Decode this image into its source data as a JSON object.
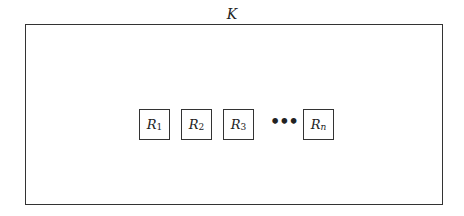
{
  "diagram": {
    "container_label": "K",
    "elements": [
      {
        "base": "R",
        "subscript": "1"
      },
      {
        "base": "R",
        "subscript": "2"
      },
      {
        "base": "R",
        "subscript": "3"
      },
      {
        "ellipsis": "•••"
      },
      {
        "base": "R",
        "subscript": "n"
      }
    ]
  }
}
